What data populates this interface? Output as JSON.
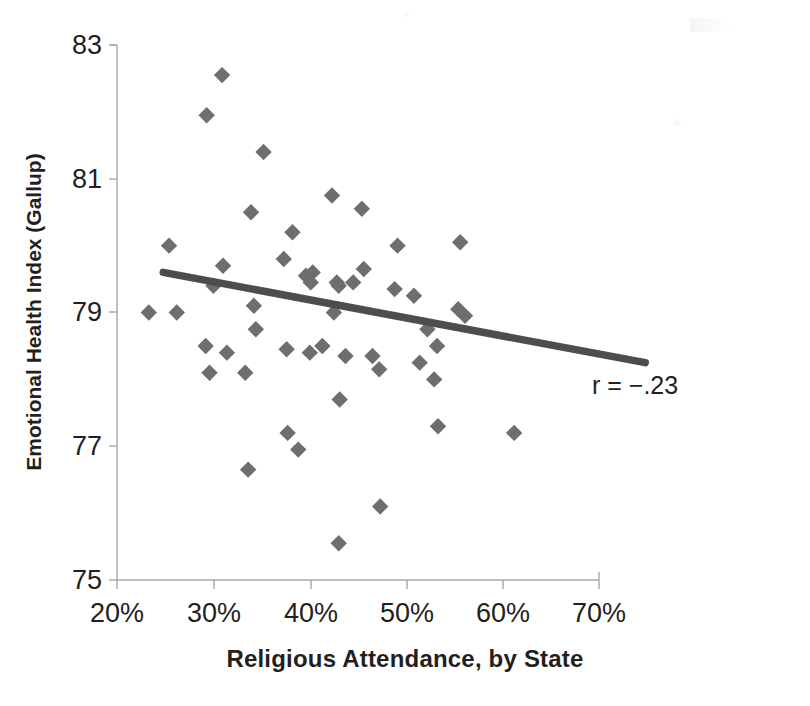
{
  "chart_data": {
    "type": "scatter",
    "title": "",
    "xlabel": "Religious Attendance, by State",
    "ylabel": "Emotional Health Index (Gallup)",
    "xlim": [
      20,
      70
    ],
    "ylim": [
      75,
      83
    ],
    "xticks": [
      20,
      30,
      40,
      50,
      60,
      70
    ],
    "xtick_labels": [
      "20%",
      "30%",
      "40%",
      "50%",
      "60%",
      "70%"
    ],
    "yticks": [
      75,
      77,
      79,
      81,
      83
    ],
    "ytick_labels": [
      "75",
      "77",
      "79",
      "81",
      "83"
    ],
    "grid": false,
    "legend": null,
    "marker": "diamond",
    "marker_color": "#6d6e70",
    "annotations": [
      {
        "text": "r = −.23",
        "x": 62.0,
        "y": 78.35
      }
    ],
    "trendline": {
      "type": "linear",
      "color": "#4d4d4f",
      "x_start": 24.8,
      "y_start": 79.6,
      "x_end": 74.8,
      "y_end": 78.25,
      "slope": -0.027,
      "r": -0.23
    },
    "points": [
      {
        "x": 23.3,
        "y": 79.0
      },
      {
        "x": 25.4,
        "y": 80.0
      },
      {
        "x": 26.2,
        "y": 79.0
      },
      {
        "x": 29.2,
        "y": 78.5
      },
      {
        "x": 29.3,
        "y": 81.95
      },
      {
        "x": 29.6,
        "y": 78.1
      },
      {
        "x": 30.0,
        "y": 79.4
      },
      {
        "x": 30.9,
        "y": 82.55
      },
      {
        "x": 31.0,
        "y": 79.7
      },
      {
        "x": 31.4,
        "y": 78.4
      },
      {
        "x": 33.3,
        "y": 78.1
      },
      {
        "x": 33.6,
        "y": 76.65
      },
      {
        "x": 33.9,
        "y": 80.5
      },
      {
        "x": 34.2,
        "y": 79.1
      },
      {
        "x": 34.4,
        "y": 78.75
      },
      {
        "x": 35.2,
        "y": 81.4
      },
      {
        "x": 37.3,
        "y": 79.8
      },
      {
        "x": 37.6,
        "y": 78.45
      },
      {
        "x": 37.7,
        "y": 77.2
      },
      {
        "x": 38.2,
        "y": 80.2
      },
      {
        "x": 38.8,
        "y": 76.95
      },
      {
        "x": 39.6,
        "y": 79.55
      },
      {
        "x": 40.1,
        "y": 79.45
      },
      {
        "x": 40.0,
        "y": 78.4
      },
      {
        "x": 40.3,
        "y": 79.6
      },
      {
        "x": 41.3,
        "y": 78.5
      },
      {
        "x": 42.3,
        "y": 80.75
      },
      {
        "x": 42.5,
        "y": 79.0
      },
      {
        "x": 42.8,
        "y": 79.45
      },
      {
        "x": 43.0,
        "y": 79.4
      },
      {
        "x": 43.1,
        "y": 77.7
      },
      {
        "x": 43.0,
        "y": 75.55
      },
      {
        "x": 43.7,
        "y": 78.35
      },
      {
        "x": 44.5,
        "y": 79.45
      },
      {
        "x": 45.4,
        "y": 80.55
      },
      {
        "x": 45.6,
        "y": 79.65
      },
      {
        "x": 46.5,
        "y": 78.35
      },
      {
        "x": 47.3,
        "y": 76.1
      },
      {
        "x": 47.2,
        "y": 78.15
      },
      {
        "x": 48.8,
        "y": 79.35
      },
      {
        "x": 49.1,
        "y": 80.0
      },
      {
        "x": 50.8,
        "y": 79.25
      },
      {
        "x": 51.4,
        "y": 78.25
      },
      {
        "x": 52.2,
        "y": 78.75
      },
      {
        "x": 52.9,
        "y": 78.0
      },
      {
        "x": 53.2,
        "y": 78.5
      },
      {
        "x": 53.3,
        "y": 77.3
      },
      {
        "x": 55.4,
        "y": 79.05
      },
      {
        "x": 55.6,
        "y": 80.05
      },
      {
        "x": 56.1,
        "y": 78.95
      },
      {
        "x": 61.2,
        "y": 77.2
      }
    ]
  },
  "axis": {
    "x_title": "Religious Attendance, by State",
    "y_title": "Emotional Health Index (Gallup)",
    "x_labels": [
      "20%",
      "30%",
      "40%",
      "50%",
      "60%",
      "70%"
    ],
    "y_labels": [
      "83",
      "81",
      "79",
      "77",
      "75"
    ]
  },
  "annotation": {
    "correlation": "r = −.23"
  },
  "colors": {
    "marker": "#6d6e70",
    "trendline": "#4d4d4f",
    "axis": "#9a9a9a",
    "text": "#231f20",
    "background": "#ffffff"
  }
}
